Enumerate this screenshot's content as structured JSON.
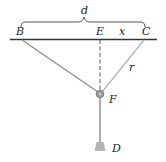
{
  "diagram": {
    "labels": {
      "d": "d",
      "B": "B",
      "E": "E",
      "x": "x",
      "C": "C",
      "r": "r",
      "F": "F",
      "D": "D"
    },
    "colors": {
      "beam": "#333333",
      "cable_left": "#8a8a8a",
      "cable_right": "#b0b0b0",
      "dashed": "#555555",
      "rod": "#9a9a9a",
      "weight": "#b5b5b5",
      "pulley": "#8c8c8c",
      "text": "#222222"
    }
  }
}
